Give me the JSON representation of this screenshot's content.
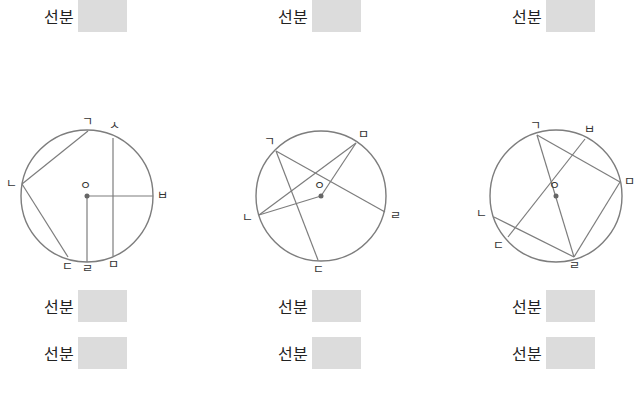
{
  "answer_label": "선분",
  "answers": [
    {
      "id": "top-1",
      "label": "선분",
      "x": 44,
      "y": 0
    },
    {
      "id": "top-2",
      "label": "선분",
      "x": 278,
      "y": 0
    },
    {
      "id": "top-3",
      "label": "선분",
      "x": 512,
      "y": 0
    },
    {
      "id": "fig1-a",
      "label": "선분",
      "x": 44,
      "y": 290
    },
    {
      "id": "fig1-b",
      "label": "선분",
      "x": 44,
      "y": 337
    },
    {
      "id": "fig2-a",
      "label": "선분",
      "x": 278,
      "y": 290
    },
    {
      "id": "fig2-b",
      "label": "선분",
      "x": 278,
      "y": 337
    },
    {
      "id": "fig3-a",
      "label": "선분",
      "x": 512,
      "y": 290
    },
    {
      "id": "fig3-b",
      "label": "선분",
      "x": 512,
      "y": 337
    }
  ],
  "figures": [
    {
      "center": {
        "label": "ㅇ",
        "x": 87,
        "y": 196
      },
      "radius": 66,
      "points": [
        {
          "label": "ㄱ",
          "x": 88,
          "y": 131,
          "lx": 82,
          "ly": 126
        },
        {
          "label": "ㅅ",
          "x": 113,
          "y": 138,
          "lx": 109,
          "ly": 130
        },
        {
          "label": "ㄴ",
          "x": 22,
          "y": 184,
          "lx": 6,
          "ly": 188
        },
        {
          "label": "ㅂ",
          "x": 153,
          "y": 196,
          "lx": 157,
          "ly": 200
        },
        {
          "label": "ㄷ",
          "x": 68,
          "y": 257,
          "lx": 62,
          "ly": 271
        },
        {
          "label": "ㄹ",
          "x": 87,
          "y": 262,
          "lx": 82,
          "ly": 273
        },
        {
          "label": "ㅁ",
          "x": 113,
          "y": 256,
          "lx": 108,
          "ly": 269
        }
      ],
      "segments": [
        [
          "ㄱ",
          "ㄴ"
        ],
        [
          "ㄴ",
          "ㄷ"
        ],
        [
          "ㅅ",
          "ㅁ"
        ],
        [
          "ㅇ",
          "ㅂ"
        ],
        [
          "ㅇ",
          "ㄹ"
        ]
      ]
    },
    {
      "center": {
        "label": "ㅇ",
        "x": 321,
        "y": 196
      },
      "radius": 65,
      "points": [
        {
          "label": "ㄱ",
          "x": 276,
          "y": 151,
          "lx": 264,
          "ly": 146
        },
        {
          "label": "ㅁ",
          "x": 356,
          "y": 143,
          "lx": 358,
          "ly": 139
        },
        {
          "label": "ㄴ",
          "x": 259,
          "y": 215,
          "lx": 242,
          "ly": 222
        },
        {
          "label": "ㄹ",
          "x": 385,
          "y": 212,
          "lx": 390,
          "ly": 220
        },
        {
          "label": "ㄷ",
          "x": 318,
          "y": 260,
          "lx": 313,
          "ly": 274
        }
      ],
      "segments": [
        [
          "ㄱ",
          "ㄹ"
        ],
        [
          "ㄱ",
          "ㄷ"
        ],
        [
          "ㄴ",
          "ㅁ"
        ],
        [
          "ㅇ",
          "ㅁ"
        ],
        [
          "ㅇ",
          "ㄴ"
        ]
      ]
    },
    {
      "center": {
        "label": "ㅇ",
        "x": 556,
        "y": 196
      },
      "radius": 66,
      "points": [
        {
          "label": "ㄱ",
          "x": 537,
          "y": 135,
          "lx": 530,
          "ly": 130
        },
        {
          "label": "ㅂ",
          "x": 585,
          "y": 139,
          "lx": 584,
          "ly": 134
        },
        {
          "label": "ㅁ",
          "x": 620,
          "y": 182,
          "lx": 624,
          "ly": 186
        },
        {
          "label": "ㄴ",
          "x": 494,
          "y": 217,
          "lx": 476,
          "ly": 218
        },
        {
          "label": "ㄷ",
          "x": 508,
          "y": 237,
          "lx": 493,
          "ly": 250
        },
        {
          "label": "ㄹ",
          "x": 574,
          "y": 257,
          "lx": 569,
          "ly": 270
        }
      ],
      "segments": [
        [
          "ㄱ",
          "ㅁ"
        ],
        [
          "ㄱ",
          "ㄹ"
        ],
        [
          "ㅁ",
          "ㄹ"
        ],
        [
          "ㄴ",
          "ㄹ"
        ],
        [
          "ㄷ",
          "ㅂ"
        ]
      ]
    }
  ]
}
